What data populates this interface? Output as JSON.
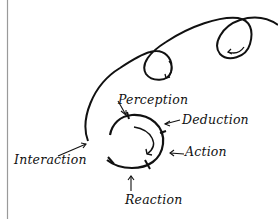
{
  "diagram": {
    "labels": {
      "perception": "Perception",
      "deduction": "Deduction",
      "action": "Action",
      "interaction": "Interaction",
      "reaction": "Reaction"
    },
    "colors": {
      "stroke": "#111111",
      "margin_line": "#9a9a9a",
      "background": "#ffffff"
    }
  }
}
